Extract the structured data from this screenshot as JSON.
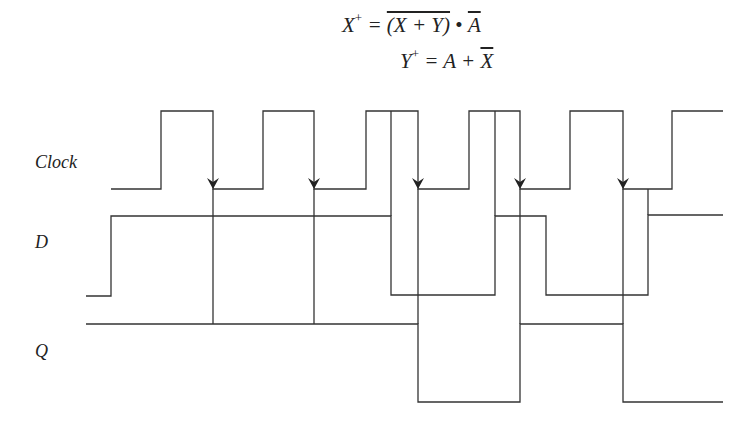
{
  "equations": {
    "x_plus": {
      "lhs": "X",
      "sup": "+",
      "eq": " = ",
      "group": "(X + Y)",
      "dot": " • ",
      "term": "A"
    },
    "y_plus": {
      "lhs": "Y",
      "sup": "+",
      "eq": " = ",
      "a": "A",
      "plus": " + ",
      "term": "X"
    }
  },
  "signals": {
    "clock": {
      "label": "Clock"
    },
    "d": {
      "label": "D"
    },
    "q": {
      "label": "Q"
    }
  },
  "colors": {
    "line": "#333333",
    "background": "#ffffff"
  }
}
